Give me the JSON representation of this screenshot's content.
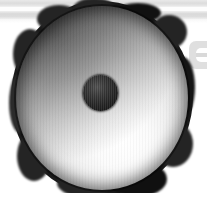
{
  "image": {
    "title": "Grayscale photograph of a round disk-shaped object",
    "subject_label": "round disk object with central hole",
    "background_label": "white background",
    "width_px": 207,
    "height_px": 199
  },
  "palette": {
    "background": "#ffffff",
    "band_gray": "#dcdcdc",
    "rim_dark": "#1a1a1a",
    "face_highlight": "#ffffff",
    "face_midtone": "#a6a6a6",
    "hole_dark": "#1c1c1c",
    "watermark_gray": "#d9d9d9"
  },
  "background_bands": [
    {
      "name": "upper-band",
      "top_px": 0,
      "height_px": 7,
      "color": "#dcdcdc"
    },
    {
      "name": "band-gap",
      "top_px": 7,
      "height_px": 4,
      "color": "#fdfdfd"
    },
    {
      "name": "lower-band",
      "top_px": 11,
      "height_px": 8,
      "color": "#d9d9d9"
    },
    {
      "name": "band-fade",
      "top_px": 19,
      "height_px": 4,
      "color": "#f6f6f6"
    }
  ],
  "watermark": {
    "label": "faint circular logo glyph",
    "position": "right edge, partially cropped",
    "left_px": 189,
    "top_px": 41,
    "color": "#d9d9d9"
  },
  "disk": {
    "label": "disk body",
    "center_x_px": 101,
    "center_y_px": 97,
    "radius_x_px": 89,
    "radius_y_px": 95,
    "rim_label": "irregular dark lumpy rim",
    "shading_label": "radial gradient, dark upper-left to bright lower-right",
    "highlight_position": "62% 74%"
  },
  "center_hole": {
    "label": "dark central hole",
    "center_x_px": 100,
    "center_y_px": 93,
    "radius_px": 18,
    "color": "#1c1c1c"
  }
}
